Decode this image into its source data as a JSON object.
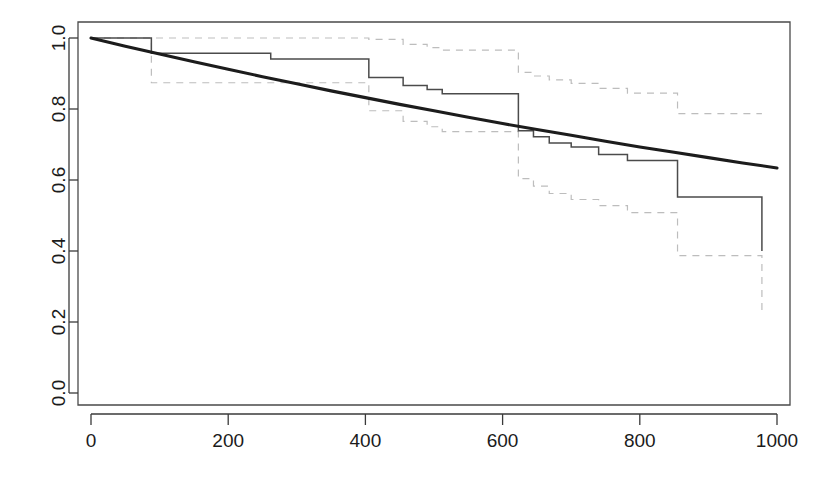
{
  "chart_data": {
    "type": "line",
    "title": "",
    "subtitle": "",
    "xlabel": "",
    "ylabel": "",
    "xlim": [
      -30,
      1030
    ],
    "ylim": [
      0.0,
      1.04
    ],
    "grid": false,
    "legend": null,
    "legend_position": "none",
    "x_ticks": [
      0,
      200,
      400,
      600,
      800,
      1000
    ],
    "x_tick_labels": [
      "0",
      "200",
      "400",
      "600",
      "800",
      "1000"
    ],
    "y_ticks": [
      0.0,
      0.2,
      0.4,
      0.6,
      0.8,
      1.0
    ],
    "y_tick_labels": [
      "0.0",
      "0.2",
      "0.4",
      "0.6",
      "0.8",
      "1.0"
    ],
    "y_axis_label_rotation": "vertical",
    "series": [
      {
        "name": "Kaplan-Meier estimate",
        "style": "step",
        "color": "#4b4b4b",
        "linewidth": 1.5,
        "dash": "solid",
        "x": [
          0,
          88,
          88,
          262,
          262,
          405,
          405,
          455,
          455,
          490,
          490,
          512,
          512,
          623,
          623,
          645,
          645,
          668,
          668,
          700,
          700,
          740,
          740,
          782,
          782,
          855,
          855,
          978,
          978
        ],
        "y": [
          1.0,
          1.0,
          0.957,
          0.957,
          0.941,
          0.941,
          0.889,
          0.889,
          0.866,
          0.866,
          0.855,
          0.855,
          0.843,
          0.843,
          0.739,
          0.739,
          0.722,
          0.722,
          0.704,
          0.704,
          0.693,
          0.693,
          0.672,
          0.672,
          0.655,
          0.655,
          0.552,
          0.552,
          0.4
        ]
      },
      {
        "name": "Upper 95% confidence limit",
        "style": "step",
        "color": "#bdbdbd",
        "linewidth": 1.2,
        "dash": "dashed",
        "x": [
          0,
          88,
          88,
          405,
          405,
          455,
          455,
          490,
          490,
          512,
          512,
          623,
          623,
          645,
          645,
          668,
          668,
          700,
          700,
          740,
          740,
          782,
          782,
          855,
          855,
          978,
          978
        ],
        "y": [
          1.0,
          1.0,
          1.0,
          1.0,
          0.996,
          0.996,
          0.982,
          0.982,
          0.973,
          0.973,
          0.966,
          0.966,
          0.903,
          0.903,
          0.893,
          0.893,
          0.882,
          0.882,
          0.872,
          0.872,
          0.858,
          0.858,
          0.845,
          0.845,
          0.787,
          0.787,
          0.787
        ]
      },
      {
        "name": "Lower 95% confidence limit",
        "style": "step",
        "color": "#bdbdbd",
        "linewidth": 1.2,
        "dash": "dashed",
        "x": [
          0,
          88,
          88,
          405,
          405,
          455,
          455,
          490,
          490,
          512,
          512,
          623,
          623,
          645,
          645,
          668,
          668,
          700,
          700,
          740,
          740,
          782,
          782,
          855,
          855,
          978,
          978
        ],
        "y": [
          1.0,
          1.0,
          0.874,
          0.874,
          0.795,
          0.795,
          0.765,
          0.765,
          0.75,
          0.75,
          0.736,
          0.736,
          0.604,
          0.604,
          0.583,
          0.583,
          0.562,
          0.562,
          0.545,
          0.545,
          0.528,
          0.528,
          0.508,
          0.508,
          0.387,
          0.387,
          0.222
        ]
      },
      {
        "name": "Fitted parametric survival curve",
        "style": "smooth",
        "color": "#1c1c1c",
        "linewidth": 3.1,
        "dash": "solid",
        "x": [
          0,
          50,
          100,
          150,
          200,
          250,
          300,
          350,
          400,
          450,
          500,
          550,
          600,
          650,
          700,
          750,
          800,
          850,
          900,
          950,
          1000
        ],
        "y": [
          1.0,
          0.977,
          0.955,
          0.933,
          0.912,
          0.891,
          0.871,
          0.851,
          0.832,
          0.813,
          0.795,
          0.777,
          0.759,
          0.742,
          0.726,
          0.709,
          0.693,
          0.678,
          0.663,
          0.648,
          0.634
        ]
      }
    ]
  },
  "figure": {
    "caption": ""
  },
  "colors": {
    "step_line": "#4b4b4b",
    "confidence_band": "#bdbdbd",
    "smooth_curve": "#1c1c1c",
    "axis": "#3a3a3a",
    "background": "#ffffff"
  }
}
